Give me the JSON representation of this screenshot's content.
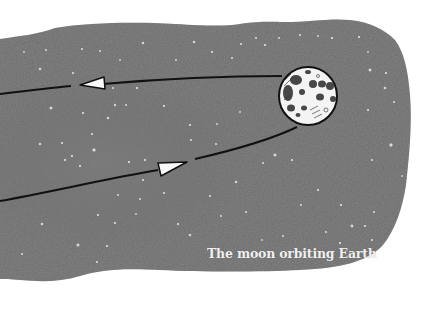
{
  "diagram": {
    "caption": "The moon orbiting Earth",
    "subject": "moon",
    "elements": [
      {
        "name": "night-sky-background",
        "description": "dark grey watercolor patch with white stars"
      },
      {
        "name": "moon-icon",
        "description": "cratered full moon, line drawing"
      },
      {
        "name": "orbit-path-upper",
        "direction": "leftward",
        "arrow": "white triangle pointing left"
      },
      {
        "name": "orbit-path-lower",
        "direction": "rightward",
        "arrow": "white triangle pointing right"
      }
    ]
  },
  "colors": {
    "sky": "#6b6b6b",
    "sky_dark": "#5a5a5a",
    "star": "#ffffff",
    "line": "#111111",
    "moon_fill": "#f4f4f4",
    "caption": "#f0f0f0",
    "page": "#ffffff"
  }
}
